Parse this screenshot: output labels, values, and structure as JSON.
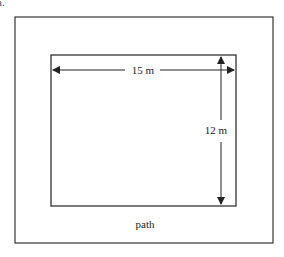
{
  "figure": {
    "corner_label": "a.",
    "outer_rect": {
      "label": "path"
    },
    "inner_rect": {
      "width_label": "15 m",
      "height_label": "12 m"
    },
    "colors": {
      "stroke": "#333333",
      "background": "#ffffff"
    }
  }
}
